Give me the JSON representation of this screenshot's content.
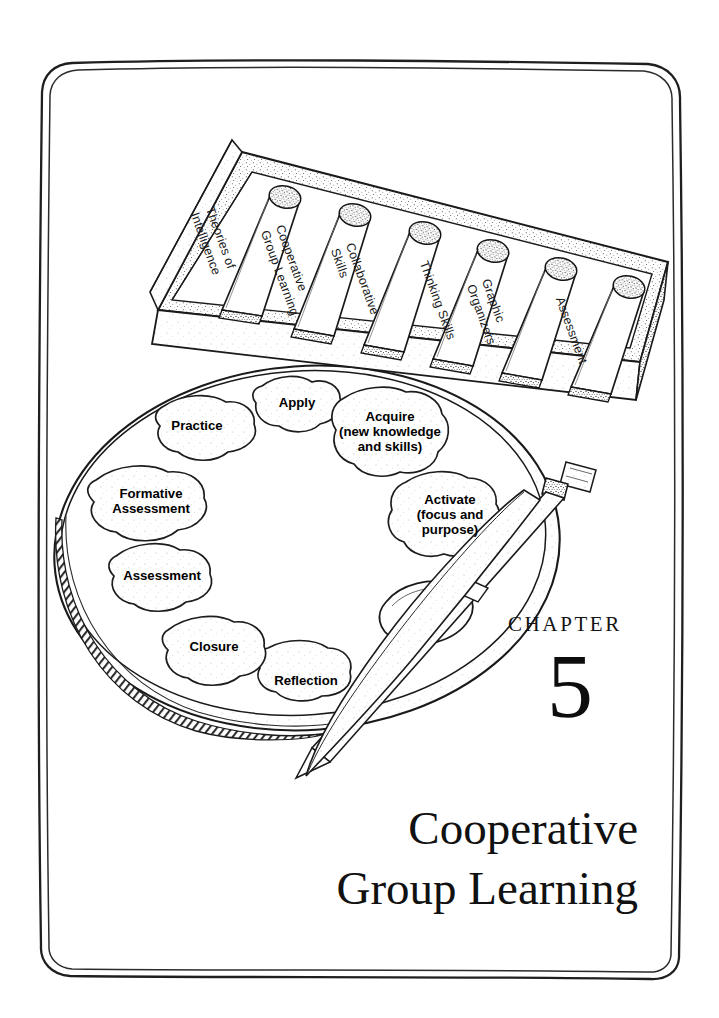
{
  "page": {
    "background_color": "#ffffff",
    "ink_color": "#111111",
    "border_style": "hand-drawn double rounded rectangle"
  },
  "chapter": {
    "label": "CHAPTER",
    "number": "5",
    "title_line1": "Cooperative",
    "title_line2": "Group Learning"
  },
  "illustration": {
    "description": "ink drawing of an artist's palette with paint blobs, two brushes, and a box of paint tubes",
    "tube_box": {
      "name": "paint-tube-box",
      "tubes": [
        {
          "label_line1": "Theories of",
          "label_line2": "Intelligence"
        },
        {
          "label_line1": "Cooperative",
          "label_line2": "Group Learning"
        },
        {
          "label_line1": "Collaborative",
          "label_line2": "Skills"
        },
        {
          "label_line1": "Thinking Skills",
          "label_line2": ""
        },
        {
          "label_line1": "Graphic",
          "label_line2": "Organizers"
        },
        {
          "label_line1": "Assessment",
          "label_line2": ""
        }
      ]
    },
    "palette": {
      "name": "artist-palette",
      "blobs": [
        {
          "line1": "Apply",
          "line2": "",
          "line3": ""
        },
        {
          "line1": "Acquire",
          "line2": "(new knowledge",
          "line3": "and skills)"
        },
        {
          "line1": "Activate",
          "line2": "(focus and",
          "line3": "purpose)"
        },
        {
          "line1": "Reflection",
          "line2": "",
          "line3": ""
        },
        {
          "line1": "Closure",
          "line2": "",
          "line3": ""
        },
        {
          "line1": "Assessment",
          "line2": "",
          "line3": ""
        },
        {
          "line1": "Formative",
          "line2": "Assessment",
          "line3": ""
        },
        {
          "line1": "Practice",
          "line2": "",
          "line3": ""
        }
      ]
    },
    "brushes": [
      {
        "name": "paintbrush-upper"
      },
      {
        "name": "paintbrush-lower"
      }
    ]
  }
}
